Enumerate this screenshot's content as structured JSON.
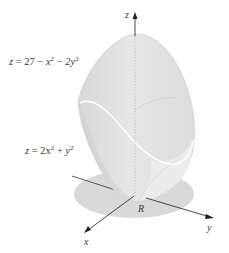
{
  "figure": {
    "type": "3d-solid-between-surfaces",
    "upper_surface": {
      "label_parts": {
        "lhs": "z",
        "eq": "=",
        "const": "27",
        "minus1": "−",
        "t1": "x",
        "exp1": "2",
        "minus2": "−",
        "t2": "2y",
        "exp2": "2"
      },
      "text": "z = 27 − x² − 2y²"
    },
    "lower_surface": {
      "label_parts": {
        "lhs": "z",
        "eq": "=",
        "t1": "2x",
        "exp1": "2",
        "plus": "+",
        "t2": "y",
        "exp2": "2"
      },
      "text": "z = 2x² + y²"
    },
    "region_label": "R",
    "axes": {
      "x": "x",
      "y": "y",
      "z": "z"
    },
    "colors": {
      "solid_fill": "#e2e2e2",
      "solid_shade": "#d2d2d2",
      "region_fill": "#d9d9d9",
      "axis": "#333333",
      "intersection_curve": "#ffffff",
      "hidden_line": "#a8a8a8"
    }
  }
}
